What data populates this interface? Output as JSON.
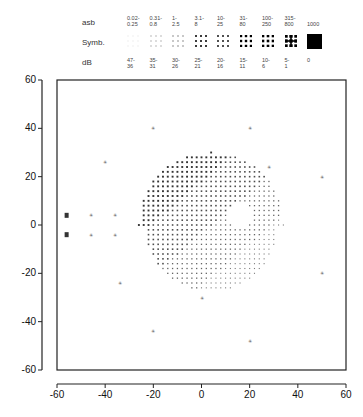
{
  "legend": {
    "row_labels": {
      "asb": "asb",
      "symb": "Symb.",
      "db": "dB"
    },
    "columns": [
      {
        "asb": [
          "0.02-",
          "0.25"
        ],
        "db": [
          "47-",
          "36"
        ],
        "level": 1
      },
      {
        "asb": [
          "0.31-",
          "0.8"
        ],
        "db": [
          "35-",
          "31"
        ],
        "level": 2
      },
      {
        "asb": [
          "1-",
          "2.5"
        ],
        "db": [
          "30-",
          "26"
        ],
        "level": 3
      },
      {
        "asb": [
          "3.1-",
          "8"
        ],
        "db": [
          "25-",
          "21"
        ],
        "level": 4
      },
      {
        "asb": [
          "10-",
          "25"
        ],
        "db": [
          "20-",
          "16"
        ],
        "level": 5
      },
      {
        "asb": [
          "31-",
          "80"
        ],
        "db": [
          "15-",
          "11"
        ],
        "level": 6
      },
      {
        "asb": [
          "100-",
          "250"
        ],
        "db": [
          "10-",
          "6"
        ],
        "level": 7
      },
      {
        "asb": [
          "315-",
          "800"
        ],
        "db": [
          "5-",
          "1"
        ],
        "level": 8
      },
      {
        "asb": [
          "1000",
          ""
        ],
        "db": [
          "0",
          ""
        ],
        "level": 9
      }
    ]
  },
  "chart_data": {
    "type": "scatter",
    "title": "",
    "xlabel": "",
    "ylabel": "",
    "xlim": [
      -60,
      60
    ],
    "ylim": [
      -60,
      60
    ],
    "xticks": [
      -60,
      -40,
      -20,
      0,
      20,
      40,
      60
    ],
    "yticks": [
      60,
      40,
      20,
      0,
      -20,
      -40,
      -60
    ],
    "grid": false,
    "central_field": {
      "center": [
        4,
        0
      ],
      "radius": 30,
      "step": 2
    },
    "dense_upper_left_level": 5,
    "sparse_lower_right_level": 2,
    "blind_spot": {
      "center": [
        16,
        4
      ],
      "radius": 5
    },
    "peripheral_points": [
      {
        "x": -20,
        "y": 40,
        "level": 2
      },
      {
        "x": 20,
        "y": 40,
        "level": 2
      },
      {
        "x": -40,
        "y": 26,
        "level": 2
      },
      {
        "x": 28,
        "y": 24,
        "level": 1
      },
      {
        "x": 50,
        "y": 20,
        "level": 2
      },
      {
        "x": -56,
        "y": 4,
        "level": 5
      },
      {
        "x": -56,
        "y": -4,
        "level": 5
      },
      {
        "x": -46,
        "y": 4,
        "level": 2
      },
      {
        "x": -46,
        "y": -4,
        "level": 2
      },
      {
        "x": -36,
        "y": 4,
        "level": 2
      },
      {
        "x": -36,
        "y": -4,
        "level": 2
      },
      {
        "x": -34,
        "y": -24,
        "level": 2
      },
      {
        "x": 50,
        "y": -20,
        "level": 2
      },
      {
        "x": -20,
        "y": -44,
        "level": 2
      },
      {
        "x": 20,
        "y": -48,
        "level": 2
      },
      {
        "x": 0,
        "y": -30,
        "level": 1
      }
    ]
  }
}
